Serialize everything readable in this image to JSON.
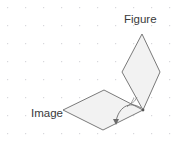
{
  "canvas": {
    "width": 184,
    "height": 149,
    "background_color": "#ffffff"
  },
  "grid": {
    "dot_color": "#d8d8dc",
    "spacing": 18,
    "offset_x": 7,
    "offset_y": 7,
    "visible": true
  },
  "labels": {
    "figure": "Figure",
    "image": "Image",
    "text_color": "#3a3a3a"
  },
  "shapes": {
    "stroke_color": "#6b6b6b",
    "fill_color": "#f2f2f2",
    "stroke_width": 0.9,
    "vertex_dot_color": "#555555",
    "figure_rhombus": {
      "name": "Figure",
      "points": "142,34 160,72 143,110 122,72",
      "vertices": [
        {
          "x": 142,
          "y": 34
        },
        {
          "x": 160,
          "y": 72
        },
        {
          "x": 143,
          "y": 110
        },
        {
          "x": 122,
          "y": 72
        }
      ]
    },
    "image_rhombus": {
      "name": "Image",
      "points": "104,90 143,110 103,130 63,110",
      "vertices": [
        {
          "x": 104,
          "y": 90
        },
        {
          "x": 143,
          "y": 110
        },
        {
          "x": 103,
          "y": 130
        },
        {
          "x": 63,
          "y": 110
        }
      ]
    }
  },
  "rotation_arrow": {
    "name": "rotation-arc",
    "color": "#6b6b6b",
    "path": "M 141,108 C 129,100 118,108 116,122",
    "arrow_tip": {
      "x": 116,
      "y": 124
    },
    "arrow_points": "113,119 119,119 116,125"
  },
  "angle_marks": {
    "color": "#7a7a7a",
    "arc1": "M 131,104 A 14 14 0 0 0 137,97",
    "arc2": "M 127,107 A 19 19 0 0 0 134,98"
  },
  "pivot_point": {
    "x": 143,
    "y": 110,
    "color": "#555555"
  }
}
